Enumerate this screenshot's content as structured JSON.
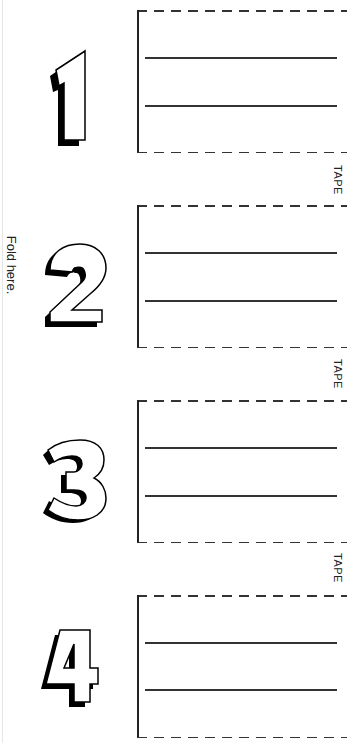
{
  "fold": {
    "label": "Fold here."
  },
  "panels": [
    {
      "number": "1",
      "lines": 2
    },
    {
      "number": "2",
      "lines": 2
    },
    {
      "number": "3",
      "lines": 2
    },
    {
      "number": "4",
      "lines": 2
    }
  ],
  "tape_labels": [
    "TAPE",
    "TAPE",
    "TAPE"
  ],
  "colors": {
    "ink": "#222222",
    "paper": "#ffffff"
  }
}
